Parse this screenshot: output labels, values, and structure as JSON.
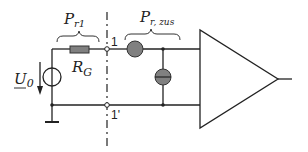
{
  "diagram": {
    "labels": {
      "p_r1_main": "P",
      "p_r1_sub": "r1",
      "p_rzus_main": "P",
      "p_rzus_sub": "r, zus",
      "rg_main": "R",
      "rg_sub": "G",
      "u0_main": "U",
      "u0_sub": "0",
      "node_1": "1",
      "node_1_prime": "1'"
    },
    "components": [
      {
        "id": "voltage-source",
        "type": "voltage source",
        "label": "U_0"
      },
      {
        "id": "resistor-rg",
        "type": "resistor",
        "label": "R_G"
      },
      {
        "id": "series-element",
        "type": "two-port series noise source"
      },
      {
        "id": "shunt-element",
        "type": "two-port parallel noise source"
      },
      {
        "id": "amplifier",
        "type": "amplifier triangle"
      }
    ],
    "colors": {
      "line": "#222222",
      "component_fill": "#808080",
      "background": "#ffffff"
    }
  }
}
